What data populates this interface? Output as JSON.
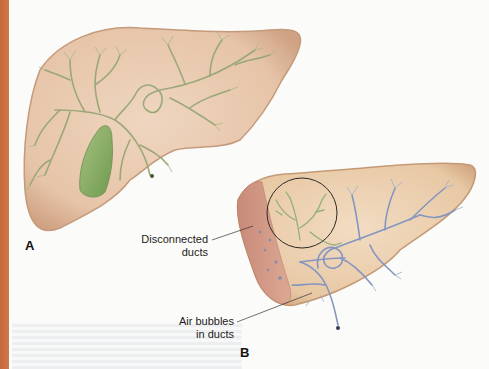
{
  "figure": {
    "panels": [
      {
        "id": "A",
        "label": "A",
        "description": "Normal liver with intact bile duct tree and gallbladder",
        "duct_color": "#9aa877",
        "gallbladder_color": "#8fb06a"
      },
      {
        "id": "B",
        "label": "B",
        "description": "Liver after partial resection with cut surface",
        "duct_color": "#8a9cc4",
        "disconnected_duct_color": "#92b07a",
        "cut_surface_color": "#cf9a86"
      }
    ],
    "annotations": [
      {
        "text_line1": "Disconnected",
        "text_line2": "ducts"
      },
      {
        "text_line1": "Air bubbles",
        "text_line2": "in ducts"
      }
    ]
  },
  "colors": {
    "edge_bar": "#c8683a",
    "liver_fill": "#e8c9ad",
    "liver_edge": "#c99f7d",
    "page_bg": "#fbfbf9"
  }
}
